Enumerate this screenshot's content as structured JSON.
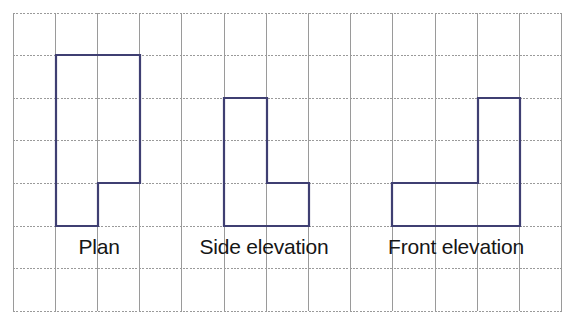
{
  "figure": {
    "kind": "isometric-views-worksheet",
    "background_color": "#ffffff",
    "grid": {
      "line_color": "#9a9a9a",
      "origin_x": 13,
      "origin_y": 13,
      "cell_width": 42.2,
      "cell_height": 42.6,
      "columns": 13,
      "rows": 7,
      "style": "dotted-square-grid"
    },
    "shape_stroke_color": "#3f3f72",
    "shape_stroke_width": 2.2,
    "shapes": [
      {
        "name": "plan",
        "label": "Plan",
        "description": "Stepped rectangle: 2 cells wide, 4 cells tall with a 1x1 notch removed from bottom-right",
        "grid_points": [
          [
            1,
            1
          ],
          [
            3,
            1
          ],
          [
            3,
            4
          ],
          [
            2,
            4
          ],
          [
            2,
            5
          ],
          [
            1,
            5
          ]
        ],
        "pixel_points": [
          [
            56,
            55
          ],
          [
            140,
            55
          ],
          [
            140,
            183
          ],
          [
            98,
            183
          ],
          [
            98,
            226
          ],
          [
            56,
            226
          ]
        ]
      },
      {
        "name": "side-elevation",
        "label": "Side elevation",
        "description": "L-shape: tall 1-cell column of height 3 on the left with a 1x1 foot extending right at the bottom",
        "grid_points": [
          [
            5,
            2
          ],
          [
            6,
            2
          ],
          [
            6,
            4
          ],
          [
            7,
            4
          ],
          [
            7,
            5
          ],
          [
            5,
            5
          ]
        ],
        "pixel_points": [
          [
            224,
            98
          ],
          [
            267,
            98
          ],
          [
            267,
            183
          ],
          [
            309,
            183
          ],
          [
            309,
            226
          ],
          [
            224,
            226
          ]
        ]
      },
      {
        "name": "front-elevation",
        "label": "Front elevation",
        "description": "Mirrored L-shape: 3 cells wide base with a 1-cell column of height 3 rising on the right",
        "grid_points": [
          [
            9,
            4
          ],
          [
            11,
            4
          ],
          [
            11,
            2
          ],
          [
            12,
            2
          ],
          [
            12,
            5
          ],
          [
            9,
            5
          ]
        ],
        "pixel_points": [
          [
            392,
            183
          ],
          [
            478,
            183
          ],
          [
            478,
            98
          ],
          [
            520,
            98
          ],
          [
            520,
            226
          ],
          [
            392,
            226
          ]
        ]
      }
    ],
    "labels": [
      {
        "name": "plan-label",
        "text": "Plan",
        "x": 99,
        "y": 254,
        "anchor": "middle"
      },
      {
        "name": "side-elevation-label",
        "text": "Side elevation",
        "x": 264,
        "y": 254,
        "anchor": "middle"
      },
      {
        "name": "front-elevation-label",
        "text": "Front elevation",
        "x": 456,
        "y": 254,
        "anchor": "middle"
      }
    ]
  }
}
